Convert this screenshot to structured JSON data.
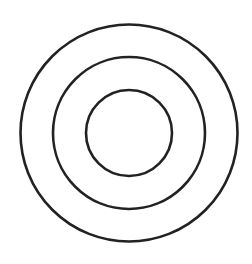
{
  "diagram": {
    "type": "concentric-circles",
    "background": "#ffffff",
    "stroke_color": "#222222",
    "stroke_width": 2.6,
    "center": {
      "x": 129,
      "y": 133
    },
    "rings": [
      {
        "name": "outer-ring",
        "r": 108.5
      },
      {
        "name": "middle-ring",
        "r": 76
      },
      {
        "name": "inner-ring",
        "r": 43
      }
    ]
  }
}
